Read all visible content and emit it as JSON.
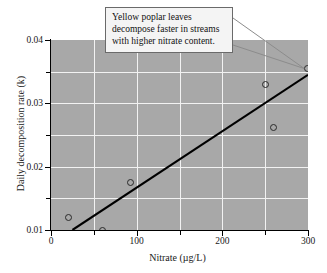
{
  "chart_data": {
    "type": "scatter",
    "title": "",
    "xlabel": "Nitrate (µg/L)",
    "ylabel": "Daily decomposition rate (k)",
    "xlim": [
      0,
      300
    ],
    "ylim": [
      0.01,
      0.04
    ],
    "grid": true,
    "legend": null,
    "x_ticks": [
      0,
      100,
      200,
      300
    ],
    "x_tick_labels": [
      "0",
      "100",
      "200",
      "300"
    ],
    "x_minor_ticks": [
      50,
      150,
      250
    ],
    "y_ticks": [
      0.01,
      0.02,
      0.03,
      0.04
    ],
    "y_tick_labels": [
      "0.01",
      "0.02",
      "0.03",
      "0.04"
    ],
    "y_minor_ticks": [
      0.015,
      0.025,
      0.035
    ],
    "points": [
      {
        "x": 20,
        "y": 0.012
      },
      {
        "x": 60,
        "y": 0.01
      },
      {
        "x": 93,
        "y": 0.0175
      },
      {
        "x": 250,
        "y": 0.033
      },
      {
        "x": 260,
        "y": 0.0262
      },
      {
        "x": 299,
        "y": 0.0355
      }
    ],
    "trend_line": {
      "x0": 25,
      "y0": 0.01,
      "x1": 300,
      "y1": 0.0345
    },
    "annotations": [
      {
        "lines": [
          "Yellow poplar leaves",
          "decompose faster in streams",
          "with higher nitrate content."
        ],
        "target_point": {
          "x": 299,
          "y": 0.0355
        }
      }
    ],
    "colors": {
      "plot_background": "#a8a8a8",
      "grid": "#f2f2f2",
      "axis": "#000000",
      "marker_edge": "#2a2a2a",
      "trend_line": "#000000",
      "callout_background": "#f4f4f4",
      "callout_border": "#6a6a6a",
      "leader_line": "#8c8c8c"
    }
  }
}
